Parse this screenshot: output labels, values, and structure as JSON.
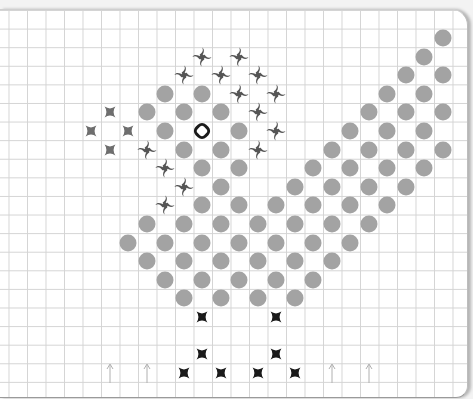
{
  "board": {
    "grid": {
      "origin_x": 17,
      "origin_y": 18.4,
      "cell_w": 18.5,
      "cell_h": 18.6
    },
    "colors": {
      "circle": "#a3a3a3",
      "swirl": "#555555",
      "gray_star": "#6e6e6e",
      "black_star": "#1a1a1a",
      "arrow": "#b0b0b0",
      "ring": "#1a1a1a"
    },
    "pieces": {
      "circles": [
        [
          1,
          23
        ],
        [
          2,
          22
        ],
        [
          3,
          21
        ],
        [
          3,
          23
        ],
        [
          4,
          8
        ],
        [
          4,
          10
        ],
        [
          4,
          20
        ],
        [
          4,
          22
        ],
        [
          5,
          7
        ],
        [
          5,
          9
        ],
        [
          5,
          11
        ],
        [
          5,
          19
        ],
        [
          5,
          21
        ],
        [
          5,
          23
        ],
        [
          6,
          8
        ],
        [
          6,
          12
        ],
        [
          6,
          18
        ],
        [
          6,
          20
        ],
        [
          6,
          22
        ],
        [
          7,
          9
        ],
        [
          7,
          11
        ],
        [
          7,
          17
        ],
        [
          7,
          19
        ],
        [
          7,
          21
        ],
        [
          7,
          23
        ],
        [
          8,
          10
        ],
        [
          8,
          12
        ],
        [
          8,
          16
        ],
        [
          8,
          18
        ],
        [
          8,
          20
        ],
        [
          8,
          22
        ],
        [
          9,
          11
        ],
        [
          9,
          15
        ],
        [
          9,
          17
        ],
        [
          9,
          19
        ],
        [
          9,
          21
        ],
        [
          10,
          10
        ],
        [
          10,
          12
        ],
        [
          10,
          14
        ],
        [
          10,
          16
        ],
        [
          10,
          18
        ],
        [
          10,
          20
        ],
        [
          11,
          7
        ],
        [
          11,
          9
        ],
        [
          11,
          11
        ],
        [
          11,
          13
        ],
        [
          11,
          15
        ],
        [
          11,
          17
        ],
        [
          11,
          19
        ],
        [
          12,
          6
        ],
        [
          12,
          8
        ],
        [
          12,
          10
        ],
        [
          12,
          12
        ],
        [
          12,
          14
        ],
        [
          12,
          16
        ],
        [
          12,
          18
        ],
        [
          13,
          7
        ],
        [
          13,
          9
        ],
        [
          13,
          11
        ],
        [
          13,
          13
        ],
        [
          13,
          15
        ],
        [
          13,
          17
        ],
        [
          14,
          8
        ],
        [
          14,
          10
        ],
        [
          14,
          12
        ],
        [
          14,
          14
        ],
        [
          14,
          16
        ],
        [
          15,
          9
        ],
        [
          15,
          11
        ],
        [
          15,
          13
        ],
        [
          15,
          15
        ]
      ],
      "swirls": [
        [
          2,
          10
        ],
        [
          2,
          12
        ],
        [
          3,
          9
        ],
        [
          3,
          11
        ],
        [
          3,
          13
        ],
        [
          4,
          12
        ],
        [
          4,
          14
        ],
        [
          5,
          13
        ],
        [
          6,
          14
        ],
        [
          7,
          13
        ],
        [
          7,
          7
        ],
        [
          8,
          8
        ],
        [
          9,
          9
        ],
        [
          10,
          8
        ]
      ],
      "gray_stars": [
        [
          5,
          5
        ],
        [
          6,
          4
        ],
        [
          6,
          6
        ],
        [
          7,
          5
        ]
      ],
      "black_stars": [
        [
          16,
          10
        ],
        [
          16,
          14
        ],
        [
          18,
          10
        ],
        [
          18,
          14
        ],
        [
          19,
          9
        ],
        [
          19,
          11
        ],
        [
          19,
          13
        ],
        [
          19,
          15
        ]
      ],
      "arrows": [
        [
          19,
          5
        ],
        [
          19,
          7
        ],
        [
          19,
          17
        ],
        [
          19,
          19
        ]
      ],
      "ring": [
        6,
        10
      ]
    }
  }
}
